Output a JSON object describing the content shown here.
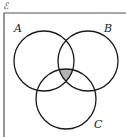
{
  "diagram": {
    "type": "venn",
    "universal_set_symbol": "ℰ",
    "sets": [
      {
        "name": "A",
        "label": "A",
        "cx": 44,
        "cy": 61,
        "r": 30,
        "label_x": 14,
        "label_y": 32
      },
      {
        "name": "B",
        "label": "B",
        "cx": 88,
        "cy": 61,
        "r": 30,
        "label_x": 104,
        "label_y": 32
      },
      {
        "name": "C",
        "label": "C",
        "cx": 66,
        "cy": 99,
        "r": 30,
        "label_x": 94,
        "label_y": 128
      }
    ],
    "shaded_region": "A ∩ B ∩ C",
    "colors": {
      "stroke": "#1a1a1a",
      "shade": "#b3b3b3",
      "border": "#555555",
      "background": "#ffffff"
    }
  }
}
